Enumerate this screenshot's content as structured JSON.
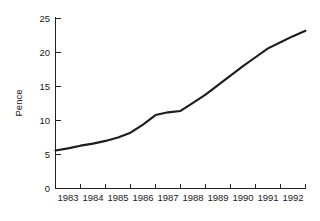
{
  "chart_data": {
    "type": "line",
    "title": "",
    "subtitle": "",
    "xlabel": "",
    "ylabel": "Pence",
    "xlim": [
      1982.5,
      1992.5
    ],
    "ylim": [
      0,
      25
    ],
    "grid": false,
    "legend": null,
    "line_color": "#1c1c1c",
    "axis_color": "#222222",
    "x_tick_labels": [
      "1983",
      "1984",
      "1985",
      "1986",
      "1987",
      "1988",
      "1989",
      "1990",
      "1991",
      "1992"
    ],
    "y_tick_labels": [
      "0",
      "5",
      "10",
      "15",
      "20",
      "25"
    ],
    "y_ticks": [
      0,
      5,
      10,
      15,
      20,
      25
    ],
    "series": [
      {
        "name": "Pence",
        "x": [
          1982.5,
          1983.0,
          1983.5,
          1984.0,
          1984.5,
          1985.0,
          1985.5,
          1986.0,
          1986.5,
          1987.0,
          1987.5,
          1988.0,
          1988.5,
          1989.0,
          1989.5,
          1990.0,
          1990.5,
          1991.0,
          1991.5,
          1992.0,
          1992.5
        ],
        "values": [
          5.6,
          5.9,
          6.3,
          6.6,
          7.0,
          7.5,
          8.2,
          9.4,
          10.8,
          11.2,
          11.4,
          12.6,
          13.8,
          15.2,
          16.6,
          18.0,
          19.3,
          20.6,
          21.5,
          22.4,
          23.2
        ]
      }
    ]
  }
}
